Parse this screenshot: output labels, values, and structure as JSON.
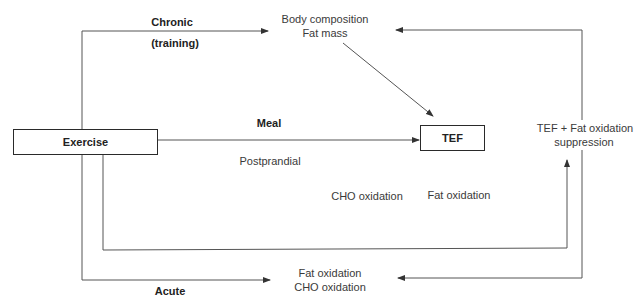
{
  "diagram": {
    "nodes": {
      "exercise": {
        "label": "Exercise"
      },
      "tef": {
        "label": "TEF"
      },
      "body_composition": {
        "line1": "Body composition",
        "line2": "Fat mass"
      },
      "tef_fat_suppression": {
        "line1": "TEF + Fat oxidation",
        "line2": "suppression"
      },
      "acute_outcome": {
        "line1": "Fat oxidation",
        "line2": "CHO oxidation"
      },
      "postprandial_cho": {
        "label": "CHO oxidation"
      },
      "postprandial_fat": {
        "label": "Fat oxidation"
      }
    },
    "edge_labels": {
      "chronic": "Chronic",
      "training": "(training)",
      "meal": "Meal",
      "postprandial": "Postprandial",
      "acute": "Acute"
    },
    "edges": [
      {
        "from": "Exercise",
        "to": "Body composition / Fat mass",
        "label": "Chronic (training)"
      },
      {
        "from": "Body composition / Fat mass",
        "to": "TEF"
      },
      {
        "from": "Exercise",
        "to": "TEF",
        "label": "Meal"
      },
      {
        "from": "Exercise",
        "to": "TEF + Fat oxidation suppression",
        "label": "Postprandial"
      },
      {
        "from": "TEF + Fat oxidation suppression",
        "to": "Body composition / Fat mass"
      },
      {
        "from": "TEF + Fat oxidation suppression",
        "to": "Fat oxidation / CHO oxidation"
      },
      {
        "from": "Exercise",
        "to": "Fat oxidation / CHO oxidation",
        "label": "Acute"
      }
    ],
    "colors": {
      "line": "#555555",
      "box_border": "#2a2a2a",
      "text": "#333333"
    }
  }
}
